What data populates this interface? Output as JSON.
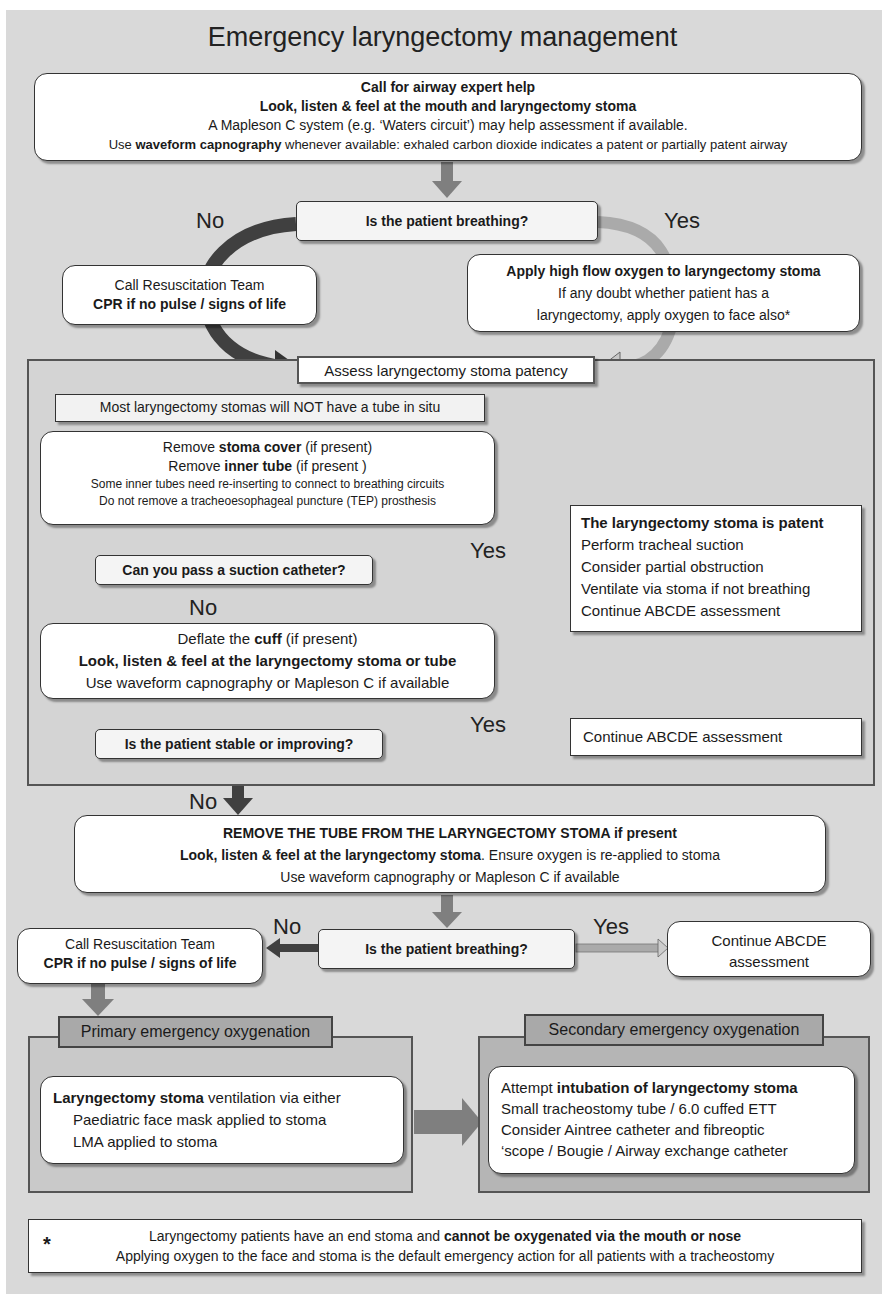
{
  "title": "Emergency laryngectomy management",
  "colors": {
    "background": "#d9d9d9",
    "box_fill": "#ffffff",
    "arrow_gray": "#7f7f7f",
    "arrow_dark": "#404040",
    "arrow_light": "#b0b0b0",
    "border": "#333333"
  },
  "top_box": {
    "line1": "Call for airway expert help",
    "line2": "Look, listen & feel at the mouth and laryngectomy stoma",
    "line3": "A Mapleson C system (e.g. ‘Waters circuit’) may help assessment if available.",
    "line4_pre": "Use ",
    "line4_bold": "waveform capnography",
    "line4_post": " whenever available:  exhaled carbon dioxide indicates a patent or partially patent airway"
  },
  "q1": {
    "text": "Is the patient breathing?",
    "no": "No",
    "yes": "Yes"
  },
  "resus1": {
    "line1": "Call Resuscitation Team",
    "line2": "CPR if no pulse / signs of life"
  },
  "oxygen_box": {
    "line1": "Apply high flow oxygen to laryngectomy stoma",
    "line2": "If any doubt whether patient has a",
    "line3": "laryngectomy, apply oxygen to face also*"
  },
  "assess_panel": {
    "header": "Assess laryngectomy stoma patency",
    "note": "Most laryngectomy stomas will NOT have a tube in situ",
    "remove_box": {
      "l1_pre": "Remove ",
      "l1_bold": "stoma cover",
      "l1_post": " (if present)",
      "l2_pre": "Remove ",
      "l2_bold": "inner tube",
      "l2_post": " (if present )",
      "l3": "Some inner tubes need re-inserting to connect to breathing circuits",
      "l4": "Do not remove a tracheoesophageal puncture (TEP) prosthesis"
    },
    "q2": {
      "text": "Can you pass a suction catheter?",
      "yes": "Yes",
      "no": "No"
    },
    "patent_box": {
      "title": "The laryngectomy stoma is patent",
      "items": [
        "Perform tracheal suction",
        "Consider partial obstruction",
        "Ventilate via stoma if not breathing",
        "Continue ABCDE assessment"
      ]
    },
    "deflate_box": {
      "l1_pre": "Deflate the ",
      "l1_bold": "cuff",
      "l1_post": " (if present)",
      "l2": "Look, listen & feel at the laryngectomy stoma or tube",
      "l3": "Use waveform capnography or Mapleson C if available"
    },
    "q3": {
      "text": "Is the patient stable or improving?",
      "yes": "Yes",
      "no": "No"
    },
    "continue_box": "Continue ABCDE assessment"
  },
  "remove_tube_box": {
    "l1": "REMOVE THE TUBE FROM THE LARYNGECTOMY STOMA if present",
    "l2_bold": "Look, listen & feel at the laryngectomy stoma",
    "l2_post": ". Ensure oxygen is re-applied to stoma",
    "l3": "Use waveform capnography or Mapleson C if available"
  },
  "q4": {
    "text": "Is the patient breathing?",
    "no": "No",
    "yes": "Yes"
  },
  "resus2": {
    "line1": "Call Resuscitation Team",
    "line2": "CPR if no pulse / signs of life"
  },
  "continue2": {
    "line1": "Continue ABCDE",
    "line2": "assessment"
  },
  "primary": {
    "header": "Primary emergency oxygenation",
    "l1_bold": "Laryngectomy stoma",
    "l1_post": " ventilation via either",
    "items": [
      "Paediatric face mask applied to stoma",
      "LMA applied to stoma"
    ]
  },
  "secondary": {
    "header": "Secondary emergency oxygenation",
    "l1_pre": "Attempt ",
    "l1_bold": "intubation of laryngectomy stoma",
    "items": [
      "Small tracheostomy tube / 6.0 cuffed ETT",
      "Consider Aintree catheter and fibreoptic",
      "‘scope / Bougie / Airway exchange catheter"
    ]
  },
  "footer": {
    "asterisk": "*",
    "l1_pre": "Laryngectomy patients have an end stoma and ",
    "l1_bold": "cannot be oxygenated via the mouth or nose",
    "l2": "Applying oxygen to the face and stoma is the default emergency action for all patients with a tracheostomy"
  }
}
